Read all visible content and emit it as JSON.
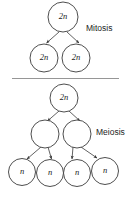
{
  "diagram": {
    "background_color": "#ffffff",
    "stroke_color": "#3a3a3a",
    "divider_color": "#8a8a8a",
    "text_color": "#1d1d1d"
  },
  "sections": {
    "mitosis": {
      "label": "Mitosis",
      "label_x": 86,
      "label_y": 29,
      "parent": {
        "label": "2n",
        "cx": 63,
        "cy": 17,
        "r": 15
      },
      "daughters": [
        {
          "label": "2n",
          "cx": 44,
          "cy": 58,
          "r": 14
        },
        {
          "label": "2n",
          "cx": 76,
          "cy": 58,
          "r": 14
        }
      ]
    },
    "meiosis": {
      "label": "Meiosis",
      "label_x": 96,
      "label_y": 133,
      "parent": {
        "label": "2n",
        "cx": 64,
        "cy": 98,
        "r": 14
      },
      "intermediates": [
        {
          "label": "",
          "cx": 45,
          "cy": 134,
          "r": 14
        },
        {
          "label": "",
          "cx": 77,
          "cy": 134,
          "r": 14
        }
      ],
      "gametes": [
        {
          "label": "n",
          "cx": 22,
          "cy": 172,
          "r": 13.5
        },
        {
          "label": "n",
          "cx": 50,
          "cy": 173,
          "r": 13.5
        },
        {
          "label": "n",
          "cx": 77,
          "cy": 173,
          "r": 13.5
        },
        {
          "label": "n",
          "cx": 105,
          "cy": 171,
          "r": 13.5
        }
      ]
    }
  },
  "divider": {
    "x1": 12,
    "y1": 78.5,
    "x2": 119,
    "y2": 78.5
  },
  "arrows": [
    {
      "name": "mitosis-parent-to-left",
      "x1": 59,
      "y1": 32,
      "x2": 46.5,
      "y2": 43
    },
    {
      "name": "mitosis-parent-to-right",
      "x1": 67,
      "y1": 32,
      "x2": 79,
      "y2": 43
    },
    {
      "name": "meiosis-parent-to-left",
      "x1": 59,
      "y1": 111,
      "x2": 47.5,
      "y2": 121
    },
    {
      "name": "meiosis-parent-to-right",
      "x1": 69,
      "y1": 111,
      "x2": 80,
      "y2": 121
    },
    {
      "name": "meiosis-left-to-gamete1",
      "x1": 41,
      "y1": 148,
      "x2": 27,
      "y2": 159
    },
    {
      "name": "meiosis-left-to-gamete2",
      "x1": 48,
      "y1": 148,
      "x2": 52,
      "y2": 159
    },
    {
      "name": "meiosis-right-to-gamete3",
      "x1": 73,
      "y1": 148,
      "x2": 72,
      "y2": 160
    },
    {
      "name": "meiosis-right-to-gamete4",
      "x1": 81,
      "y1": 148,
      "x2": 98,
      "y2": 158
    }
  ]
}
